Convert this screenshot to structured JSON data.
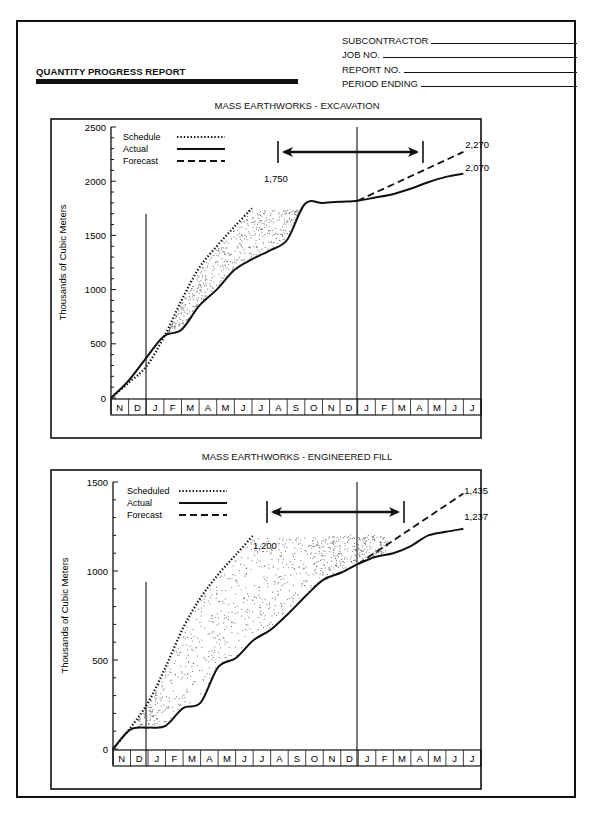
{
  "header": {
    "title": "QUANTITY PROGRESS REPORT",
    "fields": [
      {
        "label": "SUBCONTRACTOR"
      },
      {
        "label": "JOB NO."
      },
      {
        "label": "REPORT NO."
      },
      {
        "label": "PERIOD ENDING"
      }
    ]
  },
  "chart_data": [
    {
      "type": "line",
      "title": "MASS EARTHWORKS - EXCAVATION",
      "xlabel": "",
      "ylabel": "Thousands of Cubic Meters",
      "ylim": [
        0,
        2500
      ],
      "yticks": [
        0,
        500,
        1000,
        1500,
        2000,
        2500
      ],
      "categories": [
        "N",
        "D",
        "J",
        "F",
        "M",
        "A",
        "M",
        "J",
        "J",
        "A",
        "S",
        "O",
        "N",
        "D",
        "J",
        "F",
        "M",
        "A",
        "M",
        "J",
        "J"
      ],
      "legend": [
        "Schedule",
        "Actual",
        "Forecast"
      ],
      "legend_position": "top-left",
      "grid": false,
      "series": [
        {
          "name": "Schedule",
          "style": "dotted",
          "x": [
            0,
            1,
            2,
            3,
            4,
            5,
            6,
            7,
            8,
            9
          ],
          "values": [
            0,
            140,
            290,
            560,
            900,
            1200,
            1400,
            1580,
            1750,
            null
          ]
        },
        {
          "name": "Actual",
          "style": "solid",
          "x": [
            0,
            1,
            2,
            3,
            4,
            5,
            6,
            7,
            8,
            9,
            10,
            11,
            12,
            13,
            14,
            15,
            16,
            17,
            18,
            19,
            20
          ],
          "values": [
            0,
            160,
            370,
            570,
            630,
            850,
            1000,
            1180,
            1280,
            1360,
            1460,
            1790,
            1800,
            1810,
            1820,
            1850,
            1880,
            1930,
            1990,
            2040,
            2070
          ]
        },
        {
          "name": "Forecast",
          "style": "dashed",
          "x": [
            14,
            16,
            18,
            20
          ],
          "values": [
            1820,
            1950,
            2100,
            2270
          ]
        }
      ],
      "annotations": [
        {
          "text": "1,750",
          "target": "Schedule end"
        },
        {
          "text": "2,270",
          "target": "Forecast end"
        },
        {
          "text": "2,070",
          "target": "Actual end"
        }
      ],
      "markers": {
        "vertical_lines_after": [
          "D",
          "D"
        ],
        "double_arrow_span": [
          "A",
          "A"
        ]
      }
    },
    {
      "type": "line",
      "title": "MASS EARTHWORKS - ENGINEERED FILL",
      "xlabel": "",
      "ylabel": "Thousands of Cubic Meters",
      "ylim": [
        0,
        1500
      ],
      "yticks": [
        0,
        500,
        1000,
        1500
      ],
      "categories": [
        "N",
        "D",
        "J",
        "F",
        "M",
        "A",
        "M",
        "J",
        "J",
        "A",
        "S",
        "O",
        "N",
        "D",
        "J",
        "F",
        "M",
        "A",
        "M",
        "J",
        "J"
      ],
      "legend": [
        "Scheduled",
        "Actual",
        "Forecast"
      ],
      "legend_position": "top-left",
      "grid": false,
      "series": [
        {
          "name": "Scheduled",
          "style": "dotted",
          "x": [
            0,
            1,
            2,
            3,
            4,
            5,
            6,
            7,
            8,
            9
          ],
          "values": [
            0,
            120,
            260,
            460,
            680,
            850,
            980,
            1090,
            1200,
            null
          ]
        },
        {
          "name": "Actual",
          "style": "solid",
          "x": [
            0,
            1,
            2,
            3,
            4,
            5,
            6,
            7,
            8,
            9,
            10,
            11,
            12,
            13,
            14,
            15,
            16,
            17,
            18,
            19,
            20
          ],
          "values": [
            0,
            110,
            120,
            130,
            230,
            260,
            460,
            510,
            610,
            670,
            760,
            860,
            950,
            990,
            1040,
            1080,
            1100,
            1140,
            1200,
            1220,
            1237
          ]
        },
        {
          "name": "Forecast",
          "style": "dashed",
          "x": [
            14,
            16,
            18,
            20
          ],
          "values": [
            1040,
            1160,
            1300,
            1435
          ]
        }
      ],
      "annotations": [
        {
          "text": "1,200",
          "target": "Scheduled end"
        },
        {
          "text": "1,435",
          "target": "Forecast end"
        },
        {
          "text": "1,237",
          "target": "Actual end"
        }
      ],
      "markers": {
        "vertical_lines_after": [
          "D",
          "D"
        ],
        "double_arrow_span": [
          "A",
          "M"
        ]
      }
    }
  ]
}
